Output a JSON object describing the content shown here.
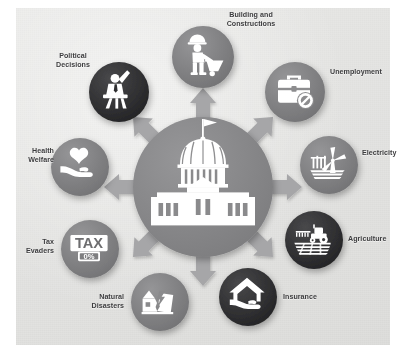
{
  "diagram": {
    "center": {
      "icon": "capitol-building-icon",
      "label": "",
      "color": "#8a8a8c"
    },
    "background_color": "#e5e5e3",
    "arrow_color": "#a9a9ab",
    "icon_color": "#ffffff",
    "arrow_count": 8,
    "nodes": [
      {
        "id": "building-and-constructions",
        "label": "Building and\nConstructions",
        "icon": "construction-worker-icon",
        "color": "#7e7e80",
        "shade": "medium"
      },
      {
        "id": "unemployment",
        "label": "Unemployment",
        "icon": "briefcase-blocked-icon",
        "color": "#8c8c8e",
        "shade": "medium"
      },
      {
        "id": "electricity",
        "label": "Electricity",
        "icon": "wind-turbine-icon",
        "color": "#7c7c7e",
        "shade": "medium"
      },
      {
        "id": "agriculture",
        "label": "Agriculture",
        "icon": "tractor-field-icon",
        "color": "#3b3b3d",
        "shade": "dark"
      },
      {
        "id": "insurance",
        "label": "Insurance",
        "icon": "house-in-hand-icon",
        "color": "#3b3b3d",
        "shade": "dark"
      },
      {
        "id": "natural-disasters",
        "label": "Natural\nDisasters",
        "icon": "cracked-house-icon",
        "color": "#8a8a8c",
        "shade": "medium"
      },
      {
        "id": "tax-evaders",
        "label": "Tax\nEvaders",
        "icon": "tax-zero-percent-sign-icon",
        "color": "#7e7e80",
        "shade": "medium",
        "icon_text": {
          "line1": "TAX",
          "line2": "0%"
        }
      },
      {
        "id": "health-welfare",
        "label": "Health\nWelfare",
        "icon": "heart-in-hand-icon",
        "color": "#6f6f71",
        "shade": "medium"
      },
      {
        "id": "political-decisions",
        "label": "Political\nDecisions",
        "icon": "person-raising-hand-icon",
        "color": "#2f2f31",
        "shade": "dark"
      }
    ]
  }
}
